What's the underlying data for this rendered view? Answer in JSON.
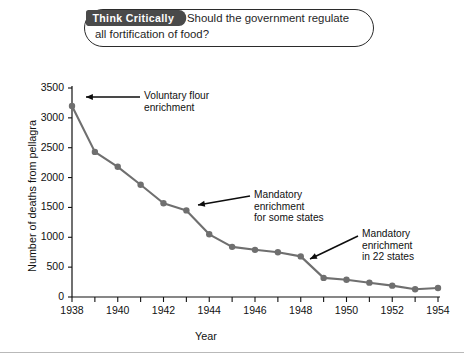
{
  "callout": {
    "tab_label": "Think Critically",
    "question_line1": "Should the government regulate",
    "question_line2": "all fortification of food?"
  },
  "chart_data": {
    "type": "line",
    "title": "",
    "xlabel": "Year",
    "ylabel": "Number of deaths from pellagra",
    "xlim": [
      1938,
      1954
    ],
    "ylim": [
      0,
      3500
    ],
    "ytick_labels": [
      "0",
      "500",
      "1000",
      "1500",
      "2000",
      "2500",
      "3000",
      "3500"
    ],
    "yticks": [
      0,
      500,
      1000,
      1500,
      2000,
      2500,
      3000,
      3500
    ],
    "xtick_labels": [
      "1938",
      "1940",
      "1942",
      "1944",
      "1946",
      "1948",
      "1950",
      "1952",
      "1954"
    ],
    "xticks": [
      1938,
      1940,
      1942,
      1944,
      1946,
      1948,
      1950,
      1952,
      1954
    ],
    "minor_xticks": [
      1939,
      1941,
      1943,
      1945,
      1947,
      1949,
      1951,
      1953
    ],
    "grid": false,
    "legend": "none",
    "line_color": "#6f6f6f",
    "marker_color": "#6f6f6f",
    "x": [
      1938,
      1939,
      1940,
      1941,
      1942,
      1943,
      1944,
      1945,
      1946,
      1947,
      1948,
      1949,
      1950,
      1951,
      1952,
      1953,
      1954
    ],
    "values": [
      3200,
      2430,
      2180,
      1880,
      1570,
      1450,
      1050,
      840,
      790,
      750,
      680,
      320,
      290,
      240,
      190,
      130,
      150
    ],
    "annotations": [
      {
        "name": "voluntary-flour-enrichment",
        "line1": "Voluntary flour",
        "line2": "enrichment",
        "line3": "",
        "points_at_year": 1938,
        "points_at_value": 3200
      },
      {
        "name": "mandatory-enrichment-some-states",
        "line1": "Mandatory",
        "line2": "enrichment",
        "line3": "for some states",
        "points_at_year": 1943,
        "points_at_value": 1450
      },
      {
        "name": "mandatory-enrichment-22-states",
        "line1": "Mandatory",
        "line2": "enrichment",
        "line3": "in 22 states",
        "points_at_year": 1948,
        "points_at_value": 680
      }
    ]
  }
}
